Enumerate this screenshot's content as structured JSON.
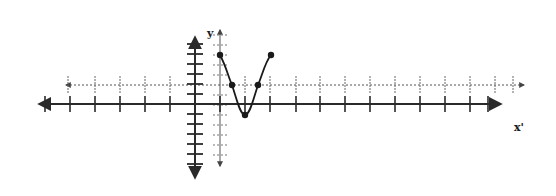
{
  "figure": {
    "labels": {
      "y_axis": "y",
      "x_axis": "x'"
    },
    "colors": {
      "axis": "#2a2a2a",
      "dotted_axis": "#555555",
      "curve": "#1a1a1a",
      "background": "#ffffff"
    },
    "solid_axes": {
      "origin_px": [
        195,
        104
      ],
      "x_range_px": [
        35,
        505
      ],
      "y_range_px": [
        33,
        182
      ],
      "tick_spacing_px": 25,
      "y_tick_spacing_px": 10
    },
    "dotted_axes": {
      "origin_px": [
        220,
        85
      ],
      "x_range_px": [
        60,
        528
      ],
      "y_range_px": [
        25,
        170
      ]
    },
    "curve": {
      "type": "cosine-like",
      "points": [
        {
          "label": "start",
          "x": 220,
          "y": 55
        },
        {
          "label": "mid-descending",
          "x": 232,
          "y": 85
        },
        {
          "label": "minimum",
          "x": 245,
          "y": 115
        },
        {
          "label": "mid-ascending",
          "x": 258,
          "y": 85
        },
        {
          "label": "end",
          "x": 271,
          "y": 55
        }
      ]
    }
  }
}
